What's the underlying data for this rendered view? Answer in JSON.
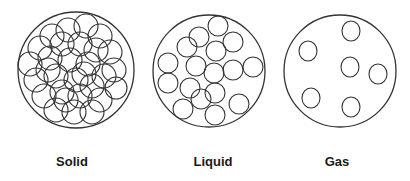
{
  "states": [
    {
      "name": "Solid",
      "label_x": 72
    },
    {
      "name": "Liquid",
      "label_x": 213
    },
    {
      "name": "Gas",
      "label_x": 337
    }
  ],
  "colors": {
    "stroke": "#333333",
    "background": "#ffffff",
    "label": "#1a1a1a"
  }
}
